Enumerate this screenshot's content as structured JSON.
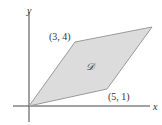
{
  "diagram": {
    "axes": {
      "x_label": "x",
      "y_label": "y"
    },
    "region": {
      "label": "𝒟",
      "fill": "#dcdcdc",
      "stroke": "#9a9a9a",
      "vertices": [
        [
          0,
          0
        ],
        [
          5,
          1
        ],
        [
          8,
          5
        ],
        [
          3,
          4
        ]
      ]
    },
    "point_labels": {
      "top_left": "(3, 4)",
      "bottom_right": "(5, 1)"
    }
  }
}
